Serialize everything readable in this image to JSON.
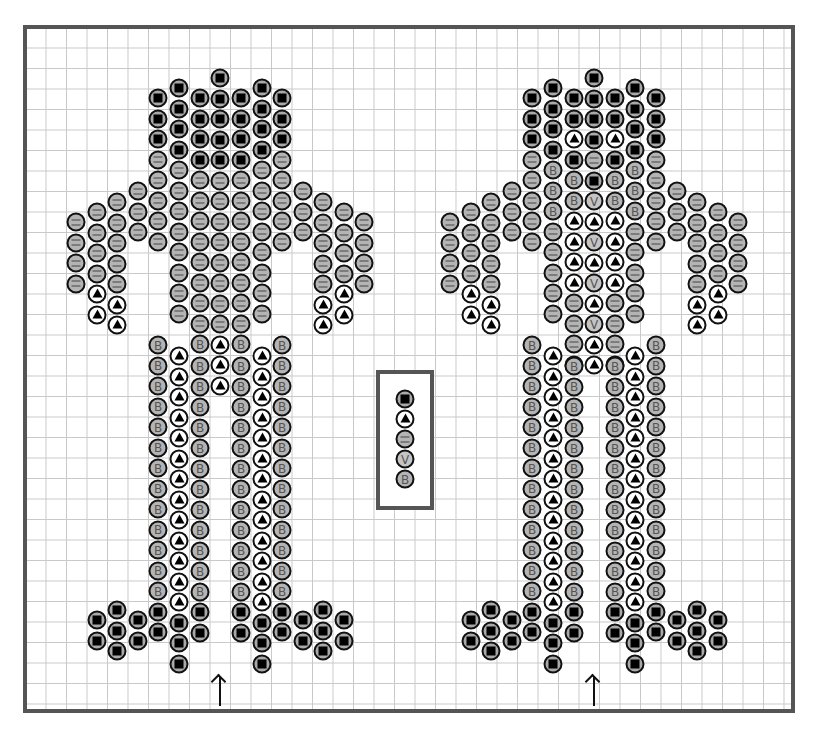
{
  "diagram": {
    "type": "peyote bead pattern",
    "figures": [
      "left-figure",
      "right-figure"
    ],
    "legend": [
      {
        "code": "K",
        "symbol": "black square",
        "description": "dark bead"
      },
      {
        "code": "T",
        "symbol": "triangle",
        "description": "white bead"
      },
      {
        "code": "E",
        "symbol": "=",
        "description": "grey bead (=)"
      },
      {
        "code": "V",
        "symbol": "V",
        "description": "light grey bead (V)"
      },
      {
        "code": "B",
        "symbol": "B",
        "description": "grey bead (B)"
      }
    ],
    "legend_labels": {
      "V": "V",
      "B": "B"
    },
    "arrows": [
      {
        "x": 220,
        "label": "start"
      },
      {
        "x": 594,
        "label": "start"
      }
    ]
  },
  "figures": {
    "left": {
      "columns": [
        {
          "x": 76,
          "y": 222,
          "beads": "EEEE"
        },
        {
          "x": 97,
          "y": 212,
          "beads": "EEEETT"
        },
        {
          "x": 117,
          "y": 202,
          "beads": "EEEEETT"
        },
        {
          "x": 138,
          "y": 191,
          "beads": "EEE"
        },
        {
          "x": 158,
          "y": 98,
          "beads": "KKKEEEEE"
        },
        {
          "x": 158,
          "y": 345,
          "beads": "BBBBBBBBBBBBBKK"
        },
        {
          "x": 179,
          "y": 88,
          "beads": "KKKKEEEEEEEE"
        },
        {
          "x": 179,
          "y": 356,
          "beads": "TTTTTTTTTTTTTKKK"
        },
        {
          "x": 200,
          "y": 98,
          "beads": "KKKKEEEEEEEEB"
        },
        {
          "x": 200,
          "y": 366,
          "beads": "BBBBBBBBBBBBKK"
        },
        {
          "x": 220,
          "y": 78,
          "beads": "KKKKKEEEEEEEETTT"
        },
        {
          "x": 241,
          "y": 98,
          "beads": "KKKKEEEEEEEEB"
        },
        {
          "x": 241,
          "y": 366,
          "beads": "BBBBBBBBBBBBKK"
        },
        {
          "x": 262,
          "y": 88,
          "beads": "KKKKEEEEEEEE"
        },
        {
          "x": 262,
          "y": 356,
          "beads": "TTTTTTTTTTTTTKKK"
        },
        {
          "x": 282,
          "y": 98,
          "beads": "KKKEEEEE"
        },
        {
          "x": 282,
          "y": 345,
          "beads": "BBBBBBBBBBBBBKK"
        },
        {
          "x": 303,
          "y": 191,
          "beads": "EEE"
        },
        {
          "x": 323,
          "y": 202,
          "beads": "EEEEETT"
        },
        {
          "x": 344,
          "y": 212,
          "beads": "EEEETT"
        },
        {
          "x": 364,
          "y": 222,
          "beads": "EEEE"
        },
        {
          "x": 97,
          "y": 620,
          "beads": "KK"
        },
        {
          "x": 117,
          "y": 610,
          "beads": "KKK"
        },
        {
          "x": 138,
          "y": 620,
          "beads": "KK"
        },
        {
          "x": 303,
          "y": 620,
          "beads": "KK"
        },
        {
          "x": 323,
          "y": 610,
          "beads": "KKK"
        },
        {
          "x": 344,
          "y": 620,
          "beads": "KK"
        }
      ]
    },
    "right": {
      "columns": [
        {
          "x": 450,
          "y": 222,
          "beads": "EEEE"
        },
        {
          "x": 471,
          "y": 212,
          "beads": "EEEETT"
        },
        {
          "x": 491,
          "y": 202,
          "beads": "EEEEETT"
        },
        {
          "x": 512,
          "y": 191,
          "beads": "EEE"
        },
        {
          "x": 532,
          "y": 98,
          "beads": "KKKEEEEE"
        },
        {
          "x": 532,
          "y": 345,
          "beads": "BBBBBBBBBBBBBKK"
        },
        {
          "x": 553,
          "y": 88,
          "beads": "KKKKBBBEEEEE"
        },
        {
          "x": 553,
          "y": 356,
          "beads": "TTTTTTTTTTTTTKKK"
        },
        {
          "x": 574,
          "y": 98,
          "beads": "KKTKBBTTTTEEEB"
        },
        {
          "x": 574,
          "y": 366,
          "beads": "BBBBBBBBBBBBKK"
        },
        {
          "x": 594,
          "y": 78,
          "beads": "KKKKEKVTVTVTVTT"
        },
        {
          "x": 615,
          "y": 98,
          "beads": "KKTKBBTTTTEEEB"
        },
        {
          "x": 615,
          "y": 366,
          "beads": "BBBBBBBBBBBBKK"
        },
        {
          "x": 635,
          "y": 88,
          "beads": "KKKKBBBEEEEE"
        },
        {
          "x": 635,
          "y": 356,
          "beads": "TTTTTTTTTTTTTKKK"
        },
        {
          "x": 656,
          "y": 98,
          "beads": "KKKEEEEE"
        },
        {
          "x": 656,
          "y": 345,
          "beads": "BBBBBBBBBBBBBKK"
        },
        {
          "x": 677,
          "y": 191,
          "beads": "EEE"
        },
        {
          "x": 697,
          "y": 202,
          "beads": "EEEEETT"
        },
        {
          "x": 718,
          "y": 212,
          "beads": "EEEETT"
        },
        {
          "x": 738,
          "y": 222,
          "beads": "EEEE"
        },
        {
          "x": 471,
          "y": 620,
          "beads": "KK"
        },
        {
          "x": 491,
          "y": 610,
          "beads": "KKK"
        },
        {
          "x": 512,
          "y": 620,
          "beads": "KK"
        },
        {
          "x": 677,
          "y": 620,
          "beads": "KK"
        },
        {
          "x": 697,
          "y": 610,
          "beads": "KKK"
        },
        {
          "x": 718,
          "y": 620,
          "beads": "KK"
        }
      ]
    }
  },
  "legend_box": {
    "x": 405,
    "y": 399,
    "beads": "KTEVB"
  }
}
